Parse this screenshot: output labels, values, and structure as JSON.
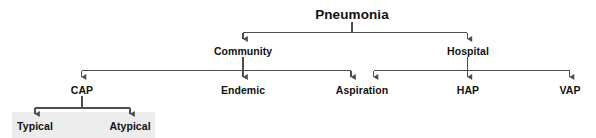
{
  "figure": {
    "kind": "hierarchy-tree",
    "background_color": "#ffffff",
    "line_color": "#4d4d4d",
    "text_color": "#111111",
    "shade_color": "#ececec"
  },
  "nodes": {
    "root": {
      "label": "Pneumonia",
      "x": 352,
      "y": 15
    },
    "community": {
      "label": "Community",
      "x": 243,
      "y": 52
    },
    "hospital": {
      "label": "Hospital",
      "x": 468,
      "y": 52
    },
    "cap": {
      "label": "CAP",
      "x": 82,
      "y": 91
    },
    "endemic": {
      "label": "Endemic",
      "x": 243,
      "y": 91
    },
    "aspiration": {
      "label": "Aspiration",
      "x": 362,
      "y": 91
    },
    "hap": {
      "label": "HAP",
      "x": 468,
      "y": 91
    },
    "vap": {
      "label": "VAP",
      "x": 570,
      "y": 91
    },
    "typical": {
      "label": "Typical",
      "x": 35,
      "y": 127
    },
    "atypical": {
      "label": "Atypical",
      "x": 130,
      "y": 127
    }
  },
  "shade_box": {
    "x": 12,
    "y": 112,
    "width": 143,
    "height": 26
  },
  "edges": [
    {
      "from": "root",
      "to": "community"
    },
    {
      "from": "root",
      "to": "hospital"
    },
    {
      "from": "community",
      "to": "cap"
    },
    {
      "from": "community",
      "to": "endemic"
    },
    {
      "from": "community",
      "to": "aspiration"
    },
    {
      "from": "hospital",
      "to": "aspiration"
    },
    {
      "from": "hospital",
      "to": "hap"
    },
    {
      "from": "hospital",
      "to": "vap"
    },
    {
      "from": "cap",
      "to": "typical"
    },
    {
      "from": "cap",
      "to": "atypical"
    }
  ]
}
